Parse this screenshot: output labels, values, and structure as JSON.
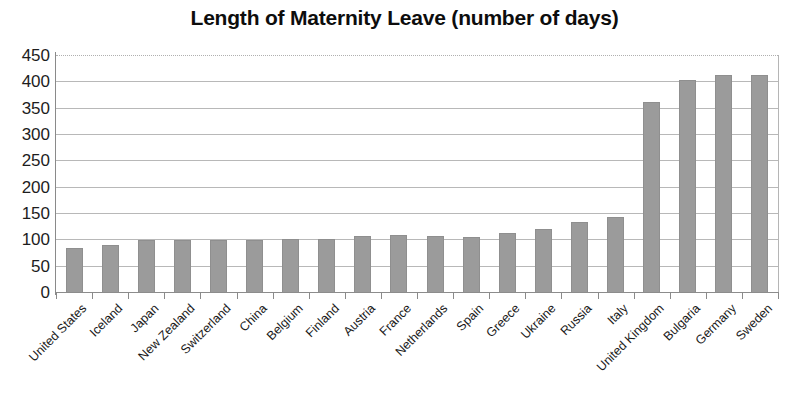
{
  "chart_data": {
    "type": "bar",
    "title": "Length of Maternity Leave (number of days)",
    "xlabel": "",
    "ylabel": "",
    "ylim": [
      0,
      450
    ],
    "ytick_step": 50,
    "yticks": [
      450,
      400,
      350,
      300,
      250,
      200,
      150,
      100,
      50,
      0
    ],
    "grid": true,
    "grid_axis": "y",
    "legend": false,
    "bar_color": "#9b9b9b",
    "categories": [
      "United States",
      "Iceland",
      "Japan",
      "New Zealand",
      "Switzerland",
      "China",
      "Belgium",
      "Finland",
      "Austria",
      "France",
      "Netherlands",
      "Spain",
      "Greece",
      "Ukraine",
      "Russia",
      "Italy",
      "United Kingdom",
      "Bulgaria",
      "Germany",
      "Sweden"
    ],
    "values": [
      84,
      90,
      98,
      98,
      98,
      98,
      101,
      101,
      106,
      108,
      107,
      105,
      112,
      120,
      133,
      143,
      360,
      402,
      413,
      412
    ]
  }
}
